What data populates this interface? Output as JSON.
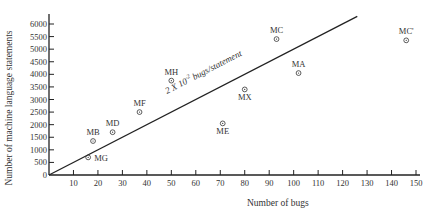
{
  "chart_data": {
    "type": "scatter",
    "title": "",
    "xlabel": "Number of bugs",
    "ylabel": "Number of machine language statements",
    "xlim": [
      0,
      150
    ],
    "ylim": [
      0,
      6000
    ],
    "x_ticks": [
      10,
      20,
      30,
      40,
      50,
      60,
      70,
      80,
      90,
      100,
      110,
      120,
      130,
      140,
      150
    ],
    "y_ticks": [
      0,
      500,
      1000,
      1500,
      2000,
      2500,
      3000,
      3500,
      4000,
      4500,
      5000,
      5500,
      6000
    ],
    "grid": false,
    "legend": null,
    "series": [
      {
        "name": "programs",
        "points": [
          {
            "label": "MG",
            "x": 16,
            "y": 700
          },
          {
            "label": "MB",
            "x": 18,
            "y": 1350
          },
          {
            "label": "MD",
            "x": 26,
            "y": 1700
          },
          {
            "label": "MF",
            "x": 37,
            "y": 2500
          },
          {
            "label": "MH",
            "x": 50,
            "y": 3750
          },
          {
            "label": "ME",
            "x": 71,
            "y": 2050
          },
          {
            "label": "MX",
            "x": 80,
            "y": 3400
          },
          {
            "label": "MC",
            "x": 93,
            "y": 5400
          },
          {
            "label": "MA",
            "x": 102,
            "y": 4050
          },
          {
            "label": "MC'",
            "x": 146,
            "y": 5350
          }
        ]
      }
    ],
    "reference_line": {
      "x0": 0,
      "y0": 0,
      "x1": 126,
      "y1": 6300
    },
    "annotations": [
      {
        "text": "2 X 10",
        "superscript": "-2",
        "suffix": " bugs/statement",
        "note": "label along reference line"
      }
    ]
  }
}
